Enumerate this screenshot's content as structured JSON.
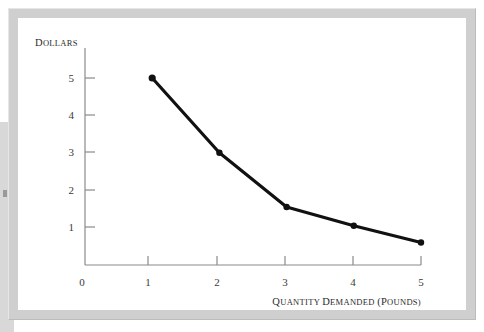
{
  "figure": {
    "background_color": "#ffffff",
    "frame_color": "#cfcfcf",
    "plot_background": "#ffffff"
  },
  "chart_data": {
    "type": "line",
    "title": "",
    "subtitle": "",
    "xlabel": "Quantity Demanded (Pounds)",
    "ylabel": "Dollars",
    "xlabel_parts": {
      "w1_first": "Q",
      "w1_rest": "UANTITY",
      "w2_first": "D",
      "w2_rest": "EMANDED",
      "w3_first": "(P",
      "w3_rest": "OUNDS)"
    },
    "ylabel_parts": {
      "first": "D",
      "rest": "OLLARS"
    },
    "x": [
      1,
      2,
      3,
      4,
      5
    ],
    "values": [
      5.0,
      3.0,
      1.55,
      1.05,
      0.6
    ],
    "series": [
      {
        "name": "Demand curve",
        "x": [
          1,
          2,
          3,
          4,
          5
        ],
        "values": [
          5.0,
          3.0,
          1.55,
          1.05,
          0.6
        ]
      }
    ],
    "xticks": [
      0,
      1,
      2,
      3,
      4,
      5
    ],
    "xtick_labels": [
      "0",
      "1",
      "2",
      "3",
      "4",
      "5"
    ],
    "yticks": [
      1,
      2,
      3,
      4,
      5
    ],
    "ytick_labels": [
      "1",
      "2",
      "3",
      "4",
      "5"
    ],
    "origin_label": "0",
    "xlim": [
      0,
      5
    ],
    "ylim": [
      0,
      5.45
    ],
    "grid": false,
    "legend": false,
    "legend_position": "none",
    "line_color": "#111111",
    "line_width": 3.2,
    "marker": "circle",
    "marker_color": "#111111",
    "axis_color": "#8a8a8a"
  },
  "ticks": {
    "x_labels": [
      "0",
      "1",
      "2",
      "3",
      "4",
      "5"
    ],
    "y_labels": [
      "5",
      "4",
      "3",
      "2",
      "1"
    ]
  }
}
